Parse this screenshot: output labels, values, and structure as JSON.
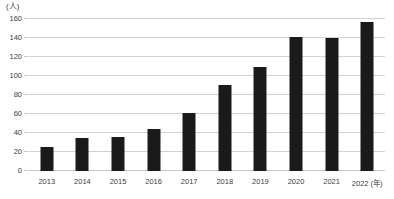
{
  "chart_data": {
    "type": "bar",
    "title": "",
    "subtitle": "",
    "xlabel": "(年)",
    "ylabel": "(人)",
    "unit_label": "(人)",
    "year_suffix": "(年)",
    "categories": [
      "2013",
      "2014",
      "2015",
      "2016",
      "2017",
      "2018",
      "2019",
      "2020",
      "2021",
      "2022"
    ],
    "values": [
      25,
      35,
      36,
      44,
      61,
      91,
      109,
      141,
      140,
      157
    ],
    "ylim": [
      0,
      160
    ],
    "ytick_labels": [
      "0",
      "20",
      "40",
      "60",
      "80",
      "100",
      "120",
      "140",
      "160"
    ],
    "ytick_values": [
      0,
      20,
      40,
      60,
      80,
      100,
      120,
      140,
      160
    ],
    "grid": "horizontal",
    "legend": "none",
    "bar_color": "#1a1a1a",
    "gridline_color": "#d2d2d2",
    "background_color": "#ffffff",
    "annotations": []
  }
}
